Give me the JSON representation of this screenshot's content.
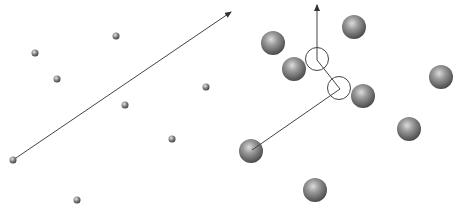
{
  "diagram": {
    "width": 464,
    "height": 213,
    "colors": {
      "background": "#ffffff",
      "line": "#444444",
      "sphere_light": "#d8d8d8",
      "sphere_mid": "#7a7a7a",
      "sphere_dark": "#3a3a3a",
      "circle_outline": "#444444"
    },
    "left_panel": {
      "description": "small particles with a long straight trajectory arrow",
      "particle_radius": 3.5,
      "particles": [
        {
          "x": 13,
          "y": 160
        },
        {
          "x": 35,
          "y": 53
        },
        {
          "x": 57,
          "y": 79
        },
        {
          "x": 116,
          "y": 36
        },
        {
          "x": 125,
          "y": 105
        },
        {
          "x": 206,
          "y": 87
        },
        {
          "x": 172,
          "y": 139
        },
        {
          "x": 77,
          "y": 200
        }
      ],
      "trajectory": {
        "x1": 13,
        "y1": 160,
        "x2": 231,
        "y2": 12
      }
    },
    "right_panel": {
      "description": "large spheres with a deflected trajectory through collision circles",
      "sphere_radius": 12,
      "spheres": [
        {
          "x": 273,
          "y": 43
        },
        {
          "x": 354,
          "y": 27
        },
        {
          "x": 294,
          "y": 69
        },
        {
          "x": 363,
          "y": 96
        },
        {
          "x": 441,
          "y": 77
        },
        {
          "x": 409,
          "y": 129
        },
        {
          "x": 251,
          "y": 151
        },
        {
          "x": 315,
          "y": 190
        }
      ],
      "collision_circles": [
        {
          "x": 317,
          "y": 59,
          "r": 11.5
        },
        {
          "x": 339,
          "y": 88,
          "r": 11.5
        }
      ],
      "trajectory_points": [
        {
          "x": 252,
          "y": 150
        },
        {
          "x": 340,
          "y": 89
        },
        {
          "x": 317,
          "y": 60
        },
        {
          "x": 317,
          "y": 5
        }
      ]
    }
  }
}
